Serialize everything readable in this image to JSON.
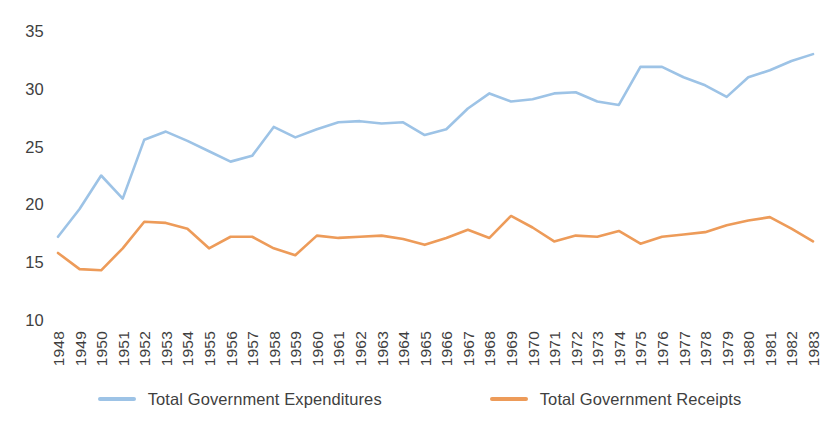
{
  "chart_data": {
    "type": "line",
    "title": "",
    "subtitle": "",
    "xlabel": "",
    "ylabel": "",
    "grid": false,
    "legend_position": "bottom",
    "ylim": [
      10,
      35
    ],
    "yticks": [
      10,
      15,
      20,
      25,
      30,
      35
    ],
    "x": [
      1948,
      1949,
      1950,
      1951,
      1952,
      1953,
      1954,
      1955,
      1956,
      1957,
      1958,
      1959,
      1960,
      1961,
      1962,
      1963,
      1964,
      1965,
      1966,
      1967,
      1968,
      1969,
      1970,
      1971,
      1972,
      1973,
      1974,
      1975,
      1976,
      1977,
      1978,
      1979,
      1980,
      1981,
      1982,
      1983
    ],
    "categories": [
      "1948",
      "1949",
      "1950",
      "1951",
      "1952",
      "1953",
      "1954",
      "1955",
      "1956",
      "1957",
      "1958",
      "1959",
      "1960",
      "1961",
      "1962",
      "1963",
      "1964",
      "1965",
      "1966",
      "1967",
      "1968",
      "1969",
      "1970",
      "1971",
      "1972",
      "1973",
      "1974",
      "1975",
      "1976",
      "1977",
      "1978",
      "1979",
      "1980",
      "1981",
      "1982",
      "1983"
    ],
    "series": [
      {
        "name": "Total Government Expenditures",
        "color": "#9DC3E6",
        "values": [
          17.2,
          19.6,
          22.5,
          20.5,
          25.6,
          26.3,
          25.5,
          24.6,
          23.7,
          24.2,
          26.7,
          25.8,
          26.5,
          27.1,
          27.2,
          27.0,
          27.1,
          26.0,
          26.5,
          28.3,
          29.6,
          28.9,
          29.1,
          29.6,
          29.7,
          28.9,
          28.6,
          31.9,
          31.9,
          31.0,
          30.3,
          29.3,
          31.0,
          31.6,
          32.4,
          33.0
        ]
      },
      {
        "name": "Total Government Receipts",
        "color": "#ED9B59",
        "values": [
          15.8,
          14.4,
          14.3,
          16.2,
          18.5,
          18.4,
          17.9,
          16.2,
          17.2,
          17.2,
          16.2,
          15.6,
          17.3,
          17.1,
          17.2,
          17.3,
          17.0,
          16.5,
          17.1,
          17.8,
          17.1,
          19.0,
          18.0,
          16.8,
          17.3,
          17.2,
          17.7,
          16.6,
          17.2,
          17.4,
          17.6,
          18.2,
          18.6,
          18.9,
          17.9,
          16.8
        ]
      }
    ]
  },
  "legend": {
    "items": [
      {
        "label": "Total Government Expenditures",
        "color": "#9DC3E6"
      },
      {
        "label": "Total Government Receipts",
        "color": "#ED9B59"
      }
    ]
  },
  "colors": {
    "expenditures": "#9DC3E6",
    "receipts": "#ED9B59",
    "text": "#3f3f3f",
    "background": "#ffffff"
  }
}
